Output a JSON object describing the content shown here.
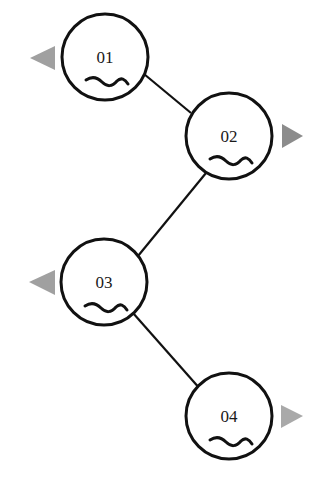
{
  "diagram": {
    "type": "zigzag-node-chain",
    "colors": {
      "background": "#ffffff",
      "stroke": "#111111",
      "label": "#1a1a1a",
      "arrow_dark": "#8c8c8c",
      "arrow_light": "#a9a9a9"
    },
    "nodes": [
      {
        "id": "01",
        "label": "01",
        "cx": 105,
        "cy": 57,
        "r": 43,
        "arrow": "left",
        "arrow_color": "#a0a0a0"
      },
      {
        "id": "02",
        "label": "02",
        "cx": 229,
        "cy": 136,
        "r": 43,
        "arrow": "right",
        "arrow_color": "#8c8c8c"
      },
      {
        "id": "03",
        "label": "03",
        "cx": 104,
        "cy": 282,
        "r": 43,
        "arrow": "left",
        "arrow_color": "#a0a0a0"
      },
      {
        "id": "04",
        "label": "04",
        "cx": 229,
        "cy": 416,
        "r": 43,
        "arrow": "right",
        "arrow_color": "#a9a9a9"
      }
    ],
    "edges": [
      {
        "from": "01",
        "to": "02"
      },
      {
        "from": "02",
        "to": "03"
      },
      {
        "from": "03",
        "to": "04"
      }
    ],
    "node_icon": "wave-icon"
  }
}
